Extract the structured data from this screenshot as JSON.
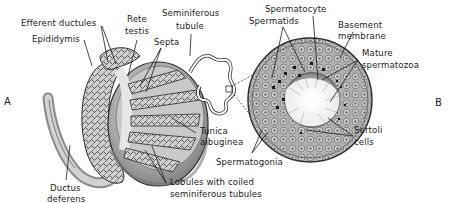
{
  "figure": {
    "panels": [
      {
        "id": "A",
        "label": "A",
        "subject": "testis"
      },
      {
        "id": "B",
        "label": "B",
        "subject": "seminiferous-tubule-cross-section"
      }
    ],
    "labels": {
      "efferent_ductules": "Efferent ductules",
      "epididymis": "Epididymis",
      "rete_testis_1": "Rete",
      "rete_testis_2": "testis",
      "septa": "Septa",
      "seminiferous_tubule_1": "Seminiferous",
      "seminiferous_tubule_2": "tubule",
      "tunica_albuginea_1": "Tunica",
      "tunica_albuginea_2": "albuginea",
      "lobules_1": "Lobules with coiled",
      "lobules_2": "seminiferous tubules",
      "ductus_deferens_1": "Ductus",
      "ductus_deferens_2": "deferens",
      "spermatids": "Spermatids",
      "spermatocyte": "Spermatocyte",
      "basement_membrane_1": "Basement",
      "basement_membrane_2": "membrane",
      "mature_spermatozoa_1": "Mature",
      "mature_spermatozoa_2": "spermatozoa",
      "sertoli_cells_1": "Sertoli",
      "sertoli_cells_2": "cells",
      "spermatogonia": "Spermatogonia"
    },
    "colors": {
      "ink": "#1c1c1c",
      "shade_dark": "#6e6e6e",
      "shade_mid": "#a8a8a8",
      "shade_light": "#d6d6d6",
      "background": "#ffffff"
    }
  }
}
